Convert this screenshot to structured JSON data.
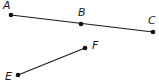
{
  "diagram": {
    "title": "",
    "points": [
      {
        "id": "A",
        "label": "A",
        "x": 11,
        "y": 15,
        "lx": 3,
        "ly": 9
      },
      {
        "id": "B",
        "label": "B",
        "x": 81,
        "y": 24,
        "lx": 78,
        "ly": 16
      },
      {
        "id": "C",
        "label": "C",
        "x": 153,
        "y": 32,
        "lx": 148,
        "ly": 24
      },
      {
        "id": "E",
        "label": "E",
        "x": 18,
        "y": 75,
        "lx": 5,
        "ly": 80
      },
      {
        "id": "F",
        "label": "F",
        "x": 85,
        "y": 48,
        "lx": 92,
        "ly": 49
      }
    ],
    "segments": [
      {
        "id": "AC",
        "from": "A",
        "to": "C",
        "through": [
          "B"
        ]
      },
      {
        "id": "EF",
        "from": "E",
        "to": "F"
      }
    ],
    "colors": {
      "line": "#1a1a1a",
      "point": "#111111",
      "background": "#ffffff"
    }
  }
}
